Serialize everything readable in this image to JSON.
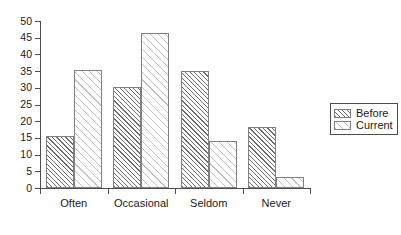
{
  "chart_data": {
    "type": "bar",
    "title": "",
    "subtitle": "",
    "xlabel": "",
    "ylabel": "",
    "categories": [
      "Often",
      "Occasional",
      "Seldom",
      "Never"
    ],
    "series": [
      {
        "name": "Before",
        "values": [
          15.5,
          30.2,
          35.1,
          18.4
        ]
      },
      {
        "name": "Current",
        "values": [
          35.3,
          46.4,
          14.0,
          3.4
        ]
      }
    ],
    "ylim": [
      0,
      50
    ],
    "yticks": [
      0,
      5,
      10,
      15,
      20,
      25,
      30,
      35,
      40,
      45,
      50
    ],
    "ytick_labels": [
      "0",
      "5",
      "10",
      "15",
      "20",
      "25",
      "30",
      "35",
      "40",
      "45",
      "50"
    ],
    "grid": false,
    "legend_position": "right",
    "legend_entries": [
      "Before",
      "Current"
    ],
    "annotations": []
  },
  "legend": {
    "items": [
      {
        "label": "Before",
        "swatch": "dense-diagonal-hatch-swatch"
      },
      {
        "label": "Current",
        "swatch": "sparse-diagonal-hatch-swatch"
      }
    ]
  }
}
